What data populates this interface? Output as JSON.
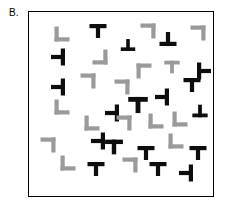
{
  "panel": {
    "label": "B.",
    "description": "visual-search-stimulus-array",
    "frame": {
      "width": 186,
      "height": 186,
      "border_color": "#000000",
      "background": "#ffffff"
    }
  },
  "colors": {
    "target_black": "#0d0d0d",
    "distractor_gray": "#9a9a9a",
    "frame_stroke": "#000000",
    "background": "#ffffff"
  },
  "legend": {
    "black_shape_name": "T-shape",
    "gray_shape_name": "L-shape"
  },
  "stimuli": [
    {
      "name": "item-01",
      "shape": "L",
      "color": "gray",
      "x": 22,
      "y": 11,
      "rot": 0,
      "scale": 1.0
    },
    {
      "name": "item-02",
      "shape": "T",
      "color": "black",
      "x": 58,
      "y": 8,
      "rot": 0,
      "scale": 1.0
    },
    {
      "name": "item-03",
      "shape": "T",
      "color": "black",
      "x": 88,
      "y": 22,
      "rot": 180,
      "scale": 0.85
    },
    {
      "name": "item-04",
      "shape": "L",
      "color": "gray",
      "x": 108,
      "y": 8,
      "rot": 180,
      "scale": 1.0
    },
    {
      "name": "item-05",
      "shape": "T",
      "color": "black",
      "x": 128,
      "y": 16,
      "rot": 180,
      "scale": 1.0
    },
    {
      "name": "item-06",
      "shape": "L",
      "color": "gray",
      "x": 158,
      "y": 10,
      "rot": 180,
      "scale": 1.0
    },
    {
      "name": "item-07",
      "shape": "T",
      "color": "black",
      "x": 18,
      "y": 34,
      "rot": 90,
      "scale": 1.0
    },
    {
      "name": "item-08",
      "shape": "L",
      "color": "gray",
      "x": 60,
      "y": 34,
      "rot": 270,
      "scale": 1.0
    },
    {
      "name": "item-09",
      "shape": "T",
      "color": "gray",
      "x": 132,
      "y": 44,
      "rot": 0,
      "scale": 0.9
    },
    {
      "name": "item-10",
      "shape": "T",
      "color": "black",
      "x": 164,
      "y": 48,
      "rot": 270,
      "scale": 1.0
    },
    {
      "name": "item-11",
      "shape": "T",
      "color": "black",
      "x": 18,
      "y": 64,
      "rot": 90,
      "scale": 1.0
    },
    {
      "name": "item-12",
      "shape": "L",
      "color": "gray",
      "x": 48,
      "y": 58,
      "rot": 180,
      "scale": 1.0
    },
    {
      "name": "item-13",
      "shape": "L",
      "color": "gray",
      "x": 82,
      "y": 64,
      "rot": 180,
      "scale": 1.0
    },
    {
      "name": "item-14",
      "shape": "L",
      "color": "gray",
      "x": 104,
      "y": 48,
      "rot": 90,
      "scale": 1.0
    },
    {
      "name": "item-15",
      "shape": "T",
      "color": "black",
      "x": 152,
      "y": 62,
      "rot": 0,
      "scale": 1.0
    },
    {
      "name": "item-16",
      "shape": "T",
      "color": "black",
      "x": 122,
      "y": 74,
      "rot": 90,
      "scale": 1.0
    },
    {
      "name": "item-17",
      "shape": "L",
      "color": "gray",
      "x": 22,
      "y": 84,
      "rot": 0,
      "scale": 1.0
    },
    {
      "name": "item-18",
      "shape": "T",
      "color": "black",
      "x": 98,
      "y": 82,
      "rot": 0,
      "scale": 1.15
    },
    {
      "name": "item-19",
      "shape": "T",
      "color": "black",
      "x": 72,
      "y": 90,
      "rot": 90,
      "scale": 1.0
    },
    {
      "name": "item-20",
      "shape": "T",
      "color": "black",
      "x": 160,
      "y": 88,
      "rot": 180,
      "scale": 0.9
    },
    {
      "name": "item-21",
      "shape": "L",
      "color": "gray",
      "x": 52,
      "y": 100,
      "rot": 0,
      "scale": 1.0
    },
    {
      "name": "item-22",
      "shape": "L",
      "color": "gray",
      "x": 84,
      "y": 100,
      "rot": 180,
      "scale": 1.0
    },
    {
      "name": "item-23",
      "shape": "L",
      "color": "gray",
      "x": 116,
      "y": 98,
      "rot": 0,
      "scale": 1.0
    },
    {
      "name": "item-24",
      "shape": "L",
      "color": "gray",
      "x": 140,
      "y": 96,
      "rot": 0,
      "scale": 1.0
    },
    {
      "name": "item-25",
      "shape": "L",
      "color": "gray",
      "x": 8,
      "y": 122,
      "rot": 180,
      "scale": 1.0
    },
    {
      "name": "item-26",
      "shape": "T",
      "color": "black",
      "x": 58,
      "y": 118,
      "rot": 90,
      "scale": 1.0
    },
    {
      "name": "item-27",
      "shape": "T",
      "color": "black",
      "x": 74,
      "y": 124,
      "rot": 0,
      "scale": 1.05
    },
    {
      "name": "item-28",
      "shape": "L",
      "color": "gray",
      "x": 136,
      "y": 118,
      "rot": 0,
      "scale": 1.0
    },
    {
      "name": "item-29",
      "shape": "T",
      "color": "black",
      "x": 158,
      "y": 130,
      "rot": 0,
      "scale": 1.0
    },
    {
      "name": "item-30",
      "shape": "T",
      "color": "black",
      "x": 106,
      "y": 130,
      "rot": 0,
      "scale": 1.0
    },
    {
      "name": "item-31",
      "shape": "L",
      "color": "gray",
      "x": 28,
      "y": 140,
      "rot": 0,
      "scale": 1.0
    },
    {
      "name": "item-32",
      "shape": "L",
      "color": "gray",
      "x": 90,
      "y": 142,
      "rot": 180,
      "scale": 1.0
    },
    {
      "name": "item-33",
      "shape": "T",
      "color": "black",
      "x": 56,
      "y": 146,
      "rot": 0,
      "scale": 1.0
    },
    {
      "name": "item-34",
      "shape": "T",
      "color": "black",
      "x": 118,
      "y": 146,
      "rot": 0,
      "scale": 1.0
    },
    {
      "name": "item-35",
      "shape": "T",
      "color": "black",
      "x": 146,
      "y": 150,
      "rot": 90,
      "scale": 1.0
    }
  ]
}
